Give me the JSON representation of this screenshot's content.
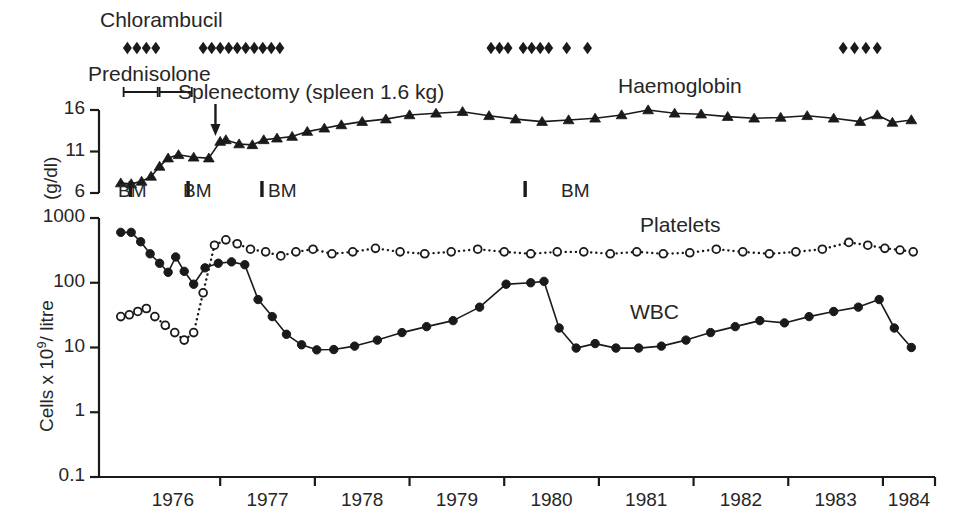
{
  "figure": {
    "title": "",
    "background": "#ffffff",
    "ink": "#1a1a1a"
  },
  "annotations": {
    "chlorambucil_label": "Chlorambucil",
    "prednisolone_label": "Prednisolone",
    "splenectomy_label": "Splenectomy (spleen 1.6 kg)",
    "haemoglobin_label": "Haemoglobin",
    "platelets_label": "Platelets",
    "wbc_label": "WBC",
    "bm_label": "BM"
  },
  "axes": {
    "top_ylabel": "(g/dl)",
    "top_yticks": [
      "16",
      "11",
      "6"
    ],
    "bottom_ylabel_parts": {
      "pre": "Cells x 10",
      "sup": "9",
      "post": "/ litre"
    },
    "bottom_yticks": [
      "1000",
      "100",
      "10",
      "1",
      "0.1"
    ],
    "xticks": [
      "1976",
      "1977",
      "1978",
      "1979",
      "1980",
      "1981",
      "1982",
      "1983",
      "1984"
    ],
    "x_range": [
      1975.72,
      1984.55
    ],
    "top_y_range": [
      6,
      16
    ],
    "bottom_y_range_log": [
      0.1,
      1000
    ]
  },
  "chart_data": {
    "type": "line",
    "xlabel": "Year",
    "panels": [
      {
        "name": "haemoglobin-panel",
        "ylabel": "(g/dl)",
        "ylim": [
          6,
          16
        ],
        "yticks": [
          6,
          11,
          16
        ],
        "grid": false,
        "series": [
          {
            "name": "Haemoglobin",
            "marker": "filled-triangle",
            "linestyle": "solid",
            "color": "#1a1a1a",
            "x": [
              1975.95,
              1976.06,
              1976.17,
              1976.27,
              1976.36,
              1976.45,
              1976.56,
              1976.72,
              1976.88,
              1977.0,
              1977.06,
              1977.2,
              1977.34,
              1977.46,
              1977.6,
              1977.76,
              1977.92,
              1978.1,
              1978.28,
              1978.5,
              1978.75,
              1979.0,
              1979.28,
              1979.56,
              1979.84,
              1980.12,
              1980.4,
              1980.68,
              1980.96,
              1981.24,
              1981.52,
              1981.8,
              1982.08,
              1982.36,
              1982.64,
              1982.92,
              1983.2,
              1983.48,
              1983.76,
              1983.94,
              1984.1,
              1984.3
            ],
            "values": [
              7.2,
              7.1,
              7.4,
              8.0,
              9.2,
              10.2,
              10.6,
              10.3,
              10.2,
              12.2,
              12.4,
              11.9,
              11.8,
              12.4,
              12.6,
              12.8,
              13.4,
              13.8,
              14.2,
              14.6,
              14.9,
              15.4,
              15.6,
              15.8,
              15.3,
              14.9,
              14.6,
              14.8,
              15.0,
              15.4,
              16.0,
              15.6,
              15.5,
              15.2,
              15.0,
              15.1,
              15.3,
              15.0,
              14.6,
              15.4,
              14.5,
              14.8
            ]
          }
        ]
      },
      {
        "name": "cells-panel",
        "ylabel": "Cells x 10^9 / litre",
        "yscale": "log",
        "ylim": [
          0.1,
          1000
        ],
        "yticks": [
          0.1,
          1,
          10,
          100,
          1000
        ],
        "grid": false,
        "series": [
          {
            "name": "WBC",
            "marker": "filled-circle",
            "linestyle": "solid",
            "color": "#1a1a1a",
            "x": [
              1975.95,
              1976.06,
              1976.16,
              1976.26,
              1976.36,
              1976.45,
              1976.53,
              1976.62,
              1976.72,
              1976.84,
              1976.98,
              1977.12,
              1977.26,
              1977.4,
              1977.55,
              1977.7,
              1977.86,
              1978.02,
              1978.2,
              1978.42,
              1978.66,
              1978.92,
              1979.18,
              1979.46,
              1979.74,
              1980.02,
              1980.28,
              1980.42,
              1980.58,
              1980.76,
              1980.96,
              1981.18,
              1981.42,
              1981.66,
              1981.92,
              1982.18,
              1982.44,
              1982.7,
              1982.96,
              1983.22,
              1983.48,
              1983.74,
              1983.96,
              1984.12,
              1984.3
            ],
            "values": [
              600,
              600,
              430,
              280,
              200,
              145,
              250,
              150,
              95,
              170,
              200,
              210,
              190,
              55,
              30,
              16,
              11,
              9.2,
              9.3,
              10.5,
              13,
              17,
              21,
              26,
              42,
              95,
              100,
              105,
              20,
              9.8,
              11.5,
              9.8,
              9.8,
              10.5,
              13,
              17,
              21,
              26,
              24,
              30,
              36,
              42,
              55,
              20,
              10
            ]
          },
          {
            "name": "Platelets",
            "marker": "open-circle",
            "linestyle": "dotted",
            "color": "#1a1a1a",
            "x": [
              1975.95,
              1976.04,
              1976.13,
              1976.22,
              1976.31,
              1976.42,
              1976.52,
              1976.62,
              1976.72,
              1976.82,
              1976.94,
              1977.06,
              1977.18,
              1977.32,
              1977.48,
              1977.64,
              1977.8,
              1977.98,
              1978.18,
              1978.4,
              1978.64,
              1978.9,
              1979.16,
              1979.44,
              1979.72,
              1980.0,
              1980.28,
              1980.56,
              1980.84,
              1981.12,
              1981.4,
              1981.68,
              1981.96,
              1982.24,
              1982.52,
              1982.8,
              1983.08,
              1983.36,
              1983.64,
              1983.84,
              1984.02,
              1984.18,
              1984.32
            ],
            "values": [
              30,
              32,
              36,
              40,
              30,
              22,
              17,
              13,
              17,
              70,
              380,
              460,
              400,
              330,
              300,
              260,
              300,
              330,
              280,
              300,
              340,
              300,
              280,
              300,
              330,
              300,
              280,
              300,
              300,
              280,
              300,
              280,
              290,
              330,
              300,
              280,
              300,
              330,
              420,
              380,
              340,
              320,
              300
            ]
          }
        ]
      }
    ],
    "event_markers": {
      "chlorambucil": {
        "label": "Chlorambucil",
        "marker": "filled-diamond",
        "x": [
          1976.02,
          1976.12,
          1976.22,
          1976.32,
          1976.82,
          1976.91,
          1977.0,
          1977.09,
          1977.18,
          1977.27,
          1977.36,
          1977.45,
          1977.54,
          1977.63,
          1979.86,
          1979.95,
          1980.04,
          1980.2,
          1980.29,
          1980.38,
          1980.47,
          1980.66,
          1980.88,
          1983.58,
          1983.7,
          1983.82,
          1983.94
        ]
      },
      "prednisolone": {
        "label": "Prednisolone",
        "segments": [
          [
            1975.98,
            1976.34
          ],
          [
            1976.36,
            1976.7
          ]
        ]
      },
      "splenectomy": {
        "label": "Splenectomy (spleen 1.6 kg)",
        "x": 1976.95
      },
      "bone_marrow": {
        "label": "BM",
        "x": [
          1976.05,
          1976.66,
          1977.44,
          1980.22
        ]
      }
    }
  }
}
